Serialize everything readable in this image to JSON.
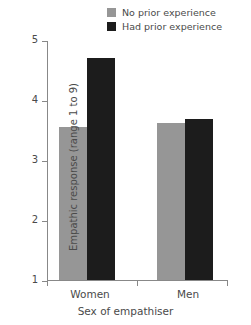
{
  "chart_data": {
    "type": "bar",
    "title": "",
    "xlabel": "Sex of empathiser",
    "ylabel": "Empathic response (range 1 to 9)",
    "categories": [
      "Women",
      "Men"
    ],
    "series": [
      {
        "name": "No prior experience",
        "color": "#969696",
        "values": [
          3.55,
          3.62
        ]
      },
      {
        "name": "Had prior experience",
        "color": "#1c1c1c",
        "values": [
          4.7,
          3.68
        ]
      }
    ],
    "ylim": [
      1,
      5
    ],
    "yticks": [
      1,
      2,
      3,
      4,
      5
    ],
    "ytick_labels": [
      "1",
      "2",
      "3",
      "4",
      "5"
    ],
    "grid": false,
    "legend_position": "top-right"
  },
  "legend": {
    "entries": [
      {
        "label": "No prior experience",
        "swatch": "legend-swatch-no-prior"
      },
      {
        "label": "Had prior experience",
        "swatch": "legend-swatch-had-prior"
      }
    ]
  },
  "axes": {
    "y_tick_labels": [
      "5",
      "4",
      "3",
      "2",
      "1"
    ],
    "x_group_labels": [
      "Women",
      "Men"
    ],
    "x_title": "Sex of empathiser",
    "y_title": "Empathic response (range 1 to 9)"
  }
}
